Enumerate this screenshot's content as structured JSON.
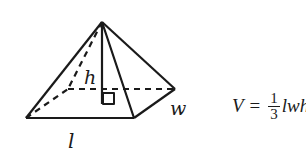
{
  "diagram": {
    "type": "square pyramid (rectangular base)",
    "labels": {
      "height": "h",
      "width": "w",
      "length": "l"
    },
    "right_angle_marker": true
  },
  "formula": {
    "lhs": "V",
    "equals": "=",
    "numerator": "1",
    "denominator": "3",
    "rhs_visible": "lwh"
  },
  "colors": {
    "stroke": "#1a1a1a",
    "background": "#ffffff"
  }
}
